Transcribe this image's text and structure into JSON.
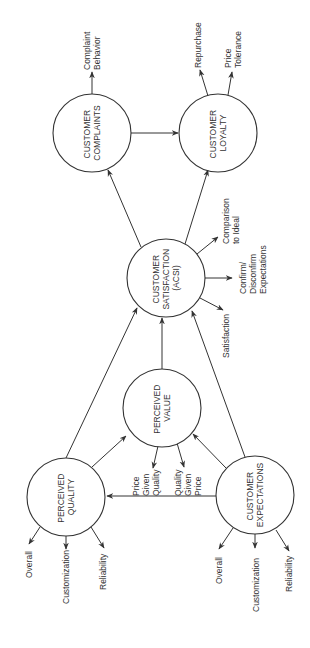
{
  "diagram": {
    "orientation": "rotated 90 degrees counter-clockwise",
    "nodes": {
      "perceived_quality": {
        "line1": "PERCEIVED",
        "line2": "QUALITY"
      },
      "perceived_value": {
        "line1": "PERCEIVED",
        "line2": "VALUE"
      },
      "customer_expectations": {
        "line1": "CUSTOMER",
        "line2": "EXPECTATIONS"
      },
      "customer_satisfaction": {
        "line1": "CUSTOMER",
        "line2": "SATISFACTION",
        "line3": "(ACSI)"
      },
      "customer_complaints": {
        "line1": "CUSTOMER",
        "line2": "COMPLAINTS"
      },
      "customer_loyalty": {
        "line1": "CUSTOMER",
        "line2": "LOYALTY"
      }
    },
    "indicators": {
      "quality": [
        "Overall",
        "Customization",
        "Reliability"
      ],
      "expectations": [
        "Overall",
        "Customization",
        "Reliability"
      ],
      "value": {
        "price_given_quality": [
          "Price",
          "Given",
          "Quality"
        ],
        "quality_given_price": [
          "Quality",
          "Given",
          "Price"
        ]
      },
      "satisfaction": {
        "satisfaction": "Satisfaction",
        "confirm": [
          "Confirm/",
          "Disconfirm",
          "Expectations"
        ],
        "comparison": [
          "Comparison",
          "to Ideal"
        ]
      },
      "complaints": [
        "Complaint",
        "Behavior"
      ],
      "loyalty": {
        "repurchase": "Repurchase",
        "price_tolerance": [
          "Price",
          "Tolerance"
        ]
      }
    },
    "edges": [
      {
        "from": "customer_expectations",
        "to": "perceived_quality"
      },
      {
        "from": "customer_expectations",
        "to": "perceived_value"
      },
      {
        "from": "customer_expectations",
        "to": "customer_satisfaction"
      },
      {
        "from": "perceived_quality",
        "to": "perceived_value"
      },
      {
        "from": "perceived_quality",
        "to": "customer_satisfaction"
      },
      {
        "from": "perceived_value",
        "to": "customer_satisfaction"
      },
      {
        "from": "customer_satisfaction",
        "to": "customer_complaints"
      },
      {
        "from": "customer_satisfaction",
        "to": "customer_loyalty"
      },
      {
        "from": "customer_complaints",
        "to": "customer_loyalty"
      }
    ],
    "colors": {
      "line": "#333333",
      "background": "#ffffff"
    }
  }
}
